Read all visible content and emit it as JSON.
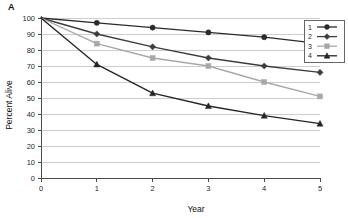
{
  "panel": {
    "label": "A"
  },
  "chart_data": {
    "type": "line",
    "title": "",
    "subtitle": "",
    "xlabel": "Year",
    "ylabel": "Percent Alive",
    "xlim": [
      0,
      5
    ],
    "ylim": [
      0,
      100
    ],
    "x": [
      0,
      1,
      2,
      3,
      4,
      5
    ],
    "xticks": [
      "0",
      "1",
      "2",
      "3",
      "4",
      "5"
    ],
    "yticks": [
      "0",
      "10",
      "20",
      "30",
      "40",
      "50",
      "60",
      "70",
      "80",
      "90",
      "100"
    ],
    "grid": "horizontal",
    "legend_position": "top-right",
    "series": [
      {
        "name": "1",
        "marker": "circle",
        "color": "#2b2b2b",
        "values": [
          100,
          97,
          94,
          91,
          88,
          84
        ]
      },
      {
        "name": "2",
        "marker": "diamond",
        "color": "#3d3d3d",
        "values": [
          100,
          90,
          82,
          75,
          70,
          66
        ]
      },
      {
        "name": "3",
        "marker": "square",
        "color": "#a8a8a8",
        "values": [
          100,
          84,
          75,
          70,
          60,
          51
        ]
      },
      {
        "name": "4",
        "marker": "triangle",
        "color": "#252525",
        "values": [
          100,
          71,
          53,
          45,
          39,
          34
        ]
      }
    ]
  },
  "legend": {
    "entries": [
      {
        "label": "1"
      },
      {
        "label": "2"
      },
      {
        "label": "3"
      },
      {
        "label": "4"
      }
    ]
  },
  "colors": {
    "axis": "#4a4a4a",
    "grid": "#b9b9b9",
    "background": "#ffffff"
  }
}
